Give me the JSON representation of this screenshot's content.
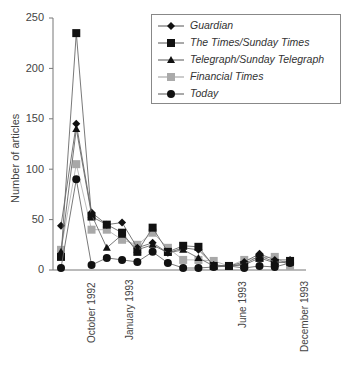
{
  "chart_data": {
    "type": "line",
    "title": "",
    "xlabel": "",
    "ylabel": "Number of articles",
    "ylim": [
      0,
      250
    ],
    "yticks": [
      0,
      50,
      100,
      150,
      200,
      250
    ],
    "grid": false,
    "legend_position": "top-right (inside, boxed)",
    "x_tick_labels": [
      {
        "label": "October 1992",
        "index": 2
      },
      {
        "label": "January 1993",
        "index": 4.5
      },
      {
        "label": "June 1993",
        "index": 12
      },
      {
        "label": "December 1993",
        "index": 16
      }
    ],
    "x": [
      0,
      1,
      2,
      3,
      4,
      5,
      6,
      7,
      8,
      9,
      10,
      11,
      12,
      13,
      14,
      15
    ],
    "series": [
      {
        "name": "Guardian",
        "marker": "diamond",
        "color": "#111111",
        "values": [
          44,
          145,
          57,
          45,
          47,
          22,
          27,
          17,
          22,
          20,
          5,
          4,
          8,
          16,
          10,
          10
        ]
      },
      {
        "name": "The Times/Sunday Times",
        "marker": "square",
        "color": "#111111",
        "values": [
          13,
          235,
          53,
          45,
          37,
          18,
          42,
          18,
          24,
          23,
          4,
          4,
          5,
          12,
          7,
          9
        ]
      },
      {
        "name": "Telegraph/Sunday Telegraph",
        "marker": "triangle",
        "color": "#111111",
        "values": [
          18,
          140,
          55,
          22,
          35,
          20,
          25,
          17,
          20,
          12,
          4,
          4,
          6,
          14,
          8,
          7
        ]
      },
      {
        "name": "Financial Times",
        "marker": "square",
        "color": "#a8a8a8",
        "values": [
          20,
          105,
          40,
          40,
          30,
          25,
          37,
          22,
          10,
          10,
          9,
          4,
          10,
          12,
          13,
          4
        ]
      },
      {
        "name": "Today",
        "marker": "circle",
        "color": "#111111",
        "values": [
          2,
          90,
          5,
          12,
          10,
          8,
          18,
          7,
          2,
          2,
          3,
          4,
          2,
          4,
          3,
          7
        ]
      }
    ]
  },
  "axes": {
    "ylabel": "Number of articles",
    "yticks": [
      "250",
      "200",
      "150",
      "100",
      "50",
      "0"
    ],
    "xticks": [
      "October 1992",
      "January 1993",
      "June 1993",
      "December 1993"
    ]
  },
  "legend": {
    "items": [
      {
        "label": "Guardian"
      },
      {
        "label": "The Times/Sunday Times"
      },
      {
        "label": "Telegraph/Sunday Telegraph"
      },
      {
        "label": "Financial Times"
      },
      {
        "label": "Today"
      }
    ]
  }
}
